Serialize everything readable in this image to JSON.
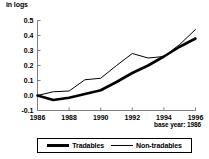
{
  "chart_data": {
    "type": "line",
    "title": "",
    "subtitle": "",
    "unit_label": "in logs",
    "xlabel": "",
    "ylabel": "",
    "note": "base year: 1986",
    "grid": false,
    "legend_position": "bottom",
    "x": [
      1986,
      1987,
      1988,
      1989,
      1990,
      1991,
      1992,
      1993,
      1994,
      1995,
      1996
    ],
    "xlim": [
      1986,
      1996
    ],
    "ylim": [
      -0.1,
      0.5
    ],
    "xticks": [
      1986,
      1988,
      1990,
      1992,
      1994,
      1996
    ],
    "xtick_labels": [
      "1986",
      "1988",
      "1990",
      "1992",
      "1994",
      "1996"
    ],
    "yticks": [
      -0.1,
      0.0,
      0.1,
      0.2,
      0.3,
      0.4,
      0.5
    ],
    "ytick_labels": [
      "-0.1",
      "0.0",
      "0.1",
      "0.2",
      "0.3",
      "0.4",
      "0.5"
    ],
    "series": [
      {
        "name": "Tradables",
        "style": "thick",
        "values": [
          0.0,
          -0.03,
          -0.015,
          0.01,
          0.035,
          0.09,
          0.15,
          0.2,
          0.26,
          0.325,
          0.38
        ]
      },
      {
        "name": "Non-tradables",
        "style": "thin",
        "values": [
          0.0,
          0.025,
          0.03,
          0.105,
          0.115,
          0.2,
          0.28,
          0.25,
          0.26,
          0.34,
          0.44
        ]
      }
    ]
  },
  "legend": {
    "entries": [
      {
        "label": "Tradables"
      },
      {
        "label": "Non-tradables"
      }
    ]
  },
  "colors": {
    "line": "#000000",
    "axis": "#7f7f7f",
    "background": "#ffffff"
  }
}
